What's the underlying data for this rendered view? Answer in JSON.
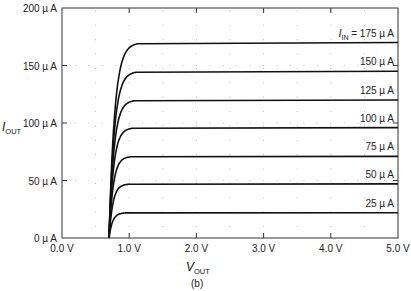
{
  "chart_data": {
    "type": "line",
    "title": "",
    "caption": "(b)",
    "xlabel": "V_OUT",
    "ylabel": "I_OUT",
    "xlim": [
      0,
      5
    ],
    "ylim": [
      0,
      200
    ],
    "x_ticks": [
      "0.0 V",
      "1.0 V",
      "2.0 V",
      "3.0 V",
      "4.0 V",
      "5.0 V"
    ],
    "y_ticks": [
      "0 µ A",
      "50 µ A",
      "100 µ A",
      "150 µ A",
      "200 µ A"
    ],
    "grid": "dotted",
    "knee_voltage": 0.7,
    "series": [
      {
        "name": "I_IN = 175 µ A",
        "label": "175 µ A",
        "saturation": 170
      },
      {
        "name": "150 µ A",
        "label": "150 µ A",
        "saturation": 145
      },
      {
        "name": "125 µ A",
        "label": "125 µ A",
        "saturation": 120
      },
      {
        "name": "100 µ A",
        "label": "100 µ A",
        "saturation": 96
      },
      {
        "name": "75 µ A",
        "label": "75 µ A",
        "saturation": 71
      },
      {
        "name": "50 µ A",
        "label": "50 µ A",
        "saturation": 47
      },
      {
        "name": "25 µ A",
        "label": "25 µ A",
        "saturation": 22
      }
    ]
  },
  "labels": {
    "iin_prefix": "I",
    "iin_sub": "IN",
    "iin_eq": " = 175 µ A",
    "x_main": "V",
    "x_sub": "OUT",
    "y_main": "I",
    "y_sub": "OUT",
    "caption": "(b)"
  }
}
